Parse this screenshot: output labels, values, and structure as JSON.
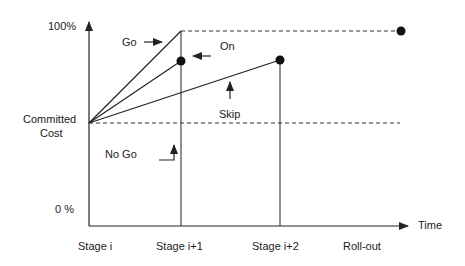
{
  "diagram": {
    "type": "stage-gate committed cost diagram",
    "y_axis": {
      "top_label": "100%",
      "mid_label_line1": "Committed",
      "mid_label_line2": "Cost",
      "bottom_label": "0 %"
    },
    "x_axis": {
      "label": "Time",
      "ticks": [
        "Stage i",
        "Stage i+1",
        "Stage i+2",
        "Roll-out"
      ]
    },
    "paths": {
      "go": "Go",
      "on": "On",
      "skip": "Skip",
      "no_go": "No Go"
    },
    "colors": {
      "line": "#222222",
      "background": "#ffffff"
    }
  }
}
